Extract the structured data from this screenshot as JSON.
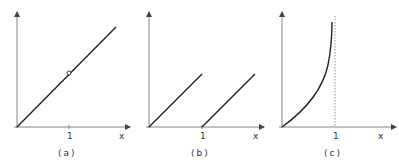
{
  "figure": {
    "panels": [
      {
        "id": "a",
        "caption": "(a)",
        "x_axis_label": "x",
        "tick_label": "1",
        "description": "Straight line y = x through origin with open circle (removable point) at x = 1"
      },
      {
        "id": "b",
        "caption": "(b)",
        "x_axis_label": "x",
        "tick_label": "1",
        "description": "Sawtooth: line from origin rising up to x = 1, then restarting from zero at x = 1 with same slope"
      },
      {
        "id": "c",
        "caption": "(c)",
        "x_axis_label": "x",
        "tick_label": "1",
        "description": "Increasing convex curve from origin approaching a vertical dashed asymptote at x = 1"
      }
    ]
  },
  "colors": {
    "axis": "#555555",
    "curve": "#222222",
    "background": "#ffffff"
  }
}
